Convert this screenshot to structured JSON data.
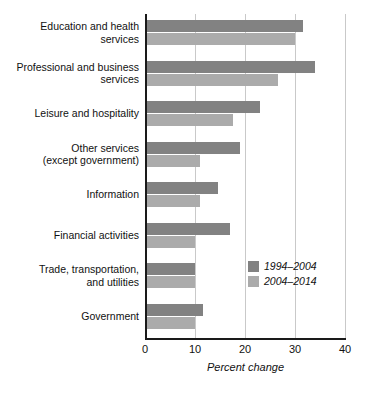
{
  "chart_data": {
    "type": "bar",
    "orientation": "horizontal",
    "title": "",
    "xlabel": "Percent change",
    "ylabel": "",
    "xlim": [
      0,
      40
    ],
    "xticks": [
      0,
      10,
      20,
      30,
      40
    ],
    "xtick_labels": [
      "0",
      "10",
      "20",
      "30",
      "40"
    ],
    "grid": true,
    "grid_axis": "x",
    "legend_position": "inside-right-lower",
    "categories": [
      "Education and health\nservices",
      "Professional and business\nservices",
      "Leisure and hospitality",
      "Other services\n(except government)",
      "Information",
      "Financial activities",
      "Trade, transportation,\nand utilities",
      "Government"
    ],
    "series": [
      {
        "name": "1994–2004",
        "color": "#828282",
        "values": [
          31.5,
          34.0,
          23.0,
          19.0,
          14.5,
          17.0,
          10.0,
          11.5
        ]
      },
      {
        "name": "2004–2014",
        "color": "#ababab",
        "values": [
          30.0,
          26.5,
          17.5,
          11.0,
          11.0,
          10.0,
          10.0,
          10.0
        ]
      }
    ]
  },
  "legend": {
    "items": [
      {
        "label": "1994–2004",
        "color": "#828282"
      },
      {
        "label": "2004–2014",
        "color": "#ababab"
      }
    ]
  },
  "axis": {
    "x_title": "Percent change",
    "tick_0": "0",
    "tick_1": "10",
    "tick_2": "20",
    "tick_3": "30",
    "tick_4": "40"
  },
  "colors": {
    "series_1994_2004": "#828282",
    "series_2004_2014": "#ababab",
    "gridline": "#c9c9c9",
    "axis": "#1a1a1a",
    "background": "#ffffff"
  }
}
